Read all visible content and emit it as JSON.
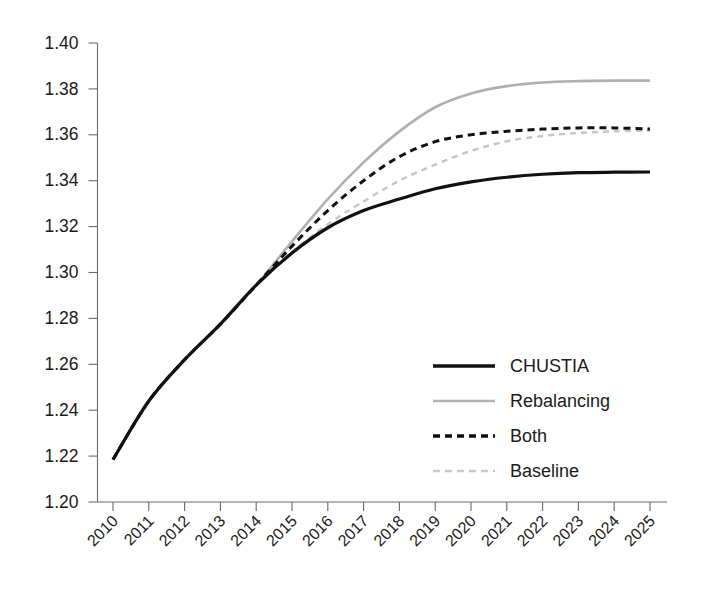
{
  "chart_data": {
    "type": "line",
    "title": "",
    "xlabel": "",
    "ylabel": "",
    "ylim": [
      1.2,
      1.4
    ],
    "xlim": [
      2010,
      2025
    ],
    "grid": false,
    "legend_position": "inside-bottom-right",
    "y_ticks": [
      "1.20",
      "1.22",
      "1.24",
      "1.26",
      "1.28",
      "1.30",
      "1.32",
      "1.34",
      "1.36",
      "1.38",
      "1.40"
    ],
    "x_ticks": [
      "2010",
      "2011",
      "2012",
      "2013",
      "2014",
      "2015",
      "2016",
      "2017",
      "2018",
      "2019",
      "2020",
      "2021",
      "2022",
      "2023",
      "2024",
      "2025"
    ],
    "x": [
      2010,
      2011,
      2012,
      2013,
      2014,
      2015,
      2016,
      2017,
      2018,
      2019,
      2020,
      2021,
      2022,
      2023,
      2024,
      2025
    ],
    "series": [
      {
        "name": "CHUSTIA",
        "color": "#111111",
        "style": "solid",
        "width": 3.2,
        "values": [
          1.2185,
          1.244,
          1.262,
          1.2775,
          1.2945,
          1.3085,
          1.3195,
          1.327,
          1.332,
          1.3365,
          1.3395,
          1.3415,
          1.3428,
          1.3435,
          1.3437,
          1.3438
        ]
      },
      {
        "name": "Rebalancing",
        "color": "#b0b0b0",
        "style": "solid",
        "width": 2.6,
        "values": [
          1.2185,
          1.244,
          1.262,
          1.2775,
          1.2945,
          1.3135,
          1.332,
          1.348,
          1.3615,
          1.372,
          1.378,
          1.3812,
          1.3828,
          1.3834,
          1.3836,
          1.3836
        ]
      },
      {
        "name": "Both",
        "color": "#111111",
        "style": "dashed",
        "width": 3.0,
        "values": [
          1.2185,
          1.244,
          1.262,
          1.2775,
          1.2945,
          1.3115,
          1.327,
          1.34,
          1.3505,
          1.357,
          1.36,
          1.3615,
          1.3625,
          1.363,
          1.363,
          1.3625
        ]
      },
      {
        "name": "Baseline",
        "color": "#c6c6c6",
        "style": "dashed",
        "width": 2.4,
        "values": [
          1.2185,
          1.244,
          1.262,
          1.2775,
          1.2945,
          1.309,
          1.321,
          1.331,
          1.34,
          1.347,
          1.353,
          1.3572,
          1.3595,
          1.3608,
          1.3615,
          1.3618
        ]
      }
    ],
    "legend": [
      {
        "label": "CHUSTIA",
        "color": "#111111",
        "style": "solid",
        "width": 3.6
      },
      {
        "label": "Rebalancing",
        "color": "#b0b0b0",
        "style": "solid",
        "width": 2.6
      },
      {
        "label": "Both",
        "color": "#111111",
        "style": "dashed",
        "width": 3.4
      },
      {
        "label": "Baseline",
        "color": "#c6c6c6",
        "style": "dashed",
        "width": 2.6
      }
    ]
  }
}
